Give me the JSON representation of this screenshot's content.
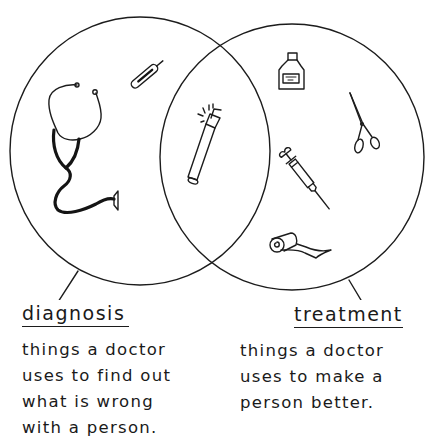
{
  "diagram": {
    "type": "venn",
    "sets": [
      {
        "id": "diagnosis",
        "title": "diagnosis",
        "description_lines": [
          "things a doctor",
          "uses to find out",
          "what is wrong",
          "with a person."
        ],
        "items": [
          "stethoscope",
          "thermometer"
        ]
      },
      {
        "id": "treatment",
        "title": "treatment",
        "description_lines": [
          "things a doctor",
          "uses to make a",
          "person better."
        ],
        "items": [
          "medicine-bottle",
          "scissors",
          "syringe",
          "bandage-roll"
        ]
      }
    ],
    "intersection": {
      "items": [
        "penlight"
      ]
    }
  },
  "colors": {
    "ink": "#1c1c1c",
    "background": "#ffffff"
  }
}
